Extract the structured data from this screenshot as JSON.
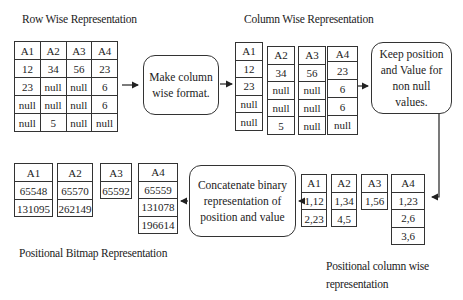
{
  "titles": {
    "row_wise": "Row Wise Representation",
    "column_wise": "Column Wise Representation",
    "positional_bitmap": "Positional Bitmap Representation",
    "positional_column_wise": "Positional column wise representation"
  },
  "process_boxes": {
    "make_column": "Make column wise format.",
    "keep_position": "Keep position and Value for non null values.",
    "concatenate": "Concatenate binary representation of position and value"
  },
  "row_wise_table": {
    "headers": [
      "A1",
      "A2",
      "A3",
      "A4"
    ],
    "rows": [
      [
        "12",
        "34",
        "56",
        "23"
      ],
      [
        "23",
        "null",
        "null",
        "6"
      ],
      [
        "null",
        "null",
        "null",
        "6"
      ],
      [
        "null",
        "5",
        "null",
        "null"
      ]
    ]
  },
  "column_wise": [
    {
      "header": "A1",
      "values": [
        "12",
        "23",
        "null",
        "null"
      ]
    },
    {
      "header": "A2",
      "values": [
        "34",
        "null",
        "null",
        "5"
      ]
    },
    {
      "header": "A3",
      "values": [
        "56",
        "null",
        "null",
        "null"
      ]
    },
    {
      "header": "A4",
      "values": [
        "23",
        "6",
        "6",
        "null"
      ]
    }
  ],
  "positional_column_wise": [
    {
      "header": "A1",
      "values": [
        "1,12",
        "2,23"
      ]
    },
    {
      "header": "A2",
      "values": [
        "1,34",
        "4,5"
      ]
    },
    {
      "header": "A3",
      "values": [
        "1,56"
      ]
    },
    {
      "header": "A4",
      "values": [
        "1,23",
        "2,6",
        "3,6"
      ]
    }
  ],
  "positional_bitmap": [
    {
      "header": "A1",
      "values": [
        "65548",
        "131095"
      ]
    },
    {
      "header": "A2",
      "values": [
        "65570",
        "262149"
      ]
    },
    {
      "header": "A3",
      "values": [
        "65592"
      ]
    },
    {
      "header": "A4",
      "values": [
        "65559",
        "131078",
        "196614"
      ]
    }
  ],
  "colors": {
    "line": "#333333",
    "text": "#222222",
    "background": "#ffffff"
  }
}
